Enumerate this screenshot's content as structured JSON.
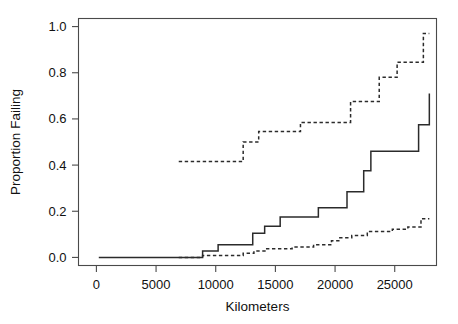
{
  "figure": {
    "background_color": "#ffffff",
    "ink_color": "#2b2b2b",
    "frame_color": "#4a4a4a"
  },
  "chart_data": {
    "type": "line",
    "title": "",
    "subtitle": "",
    "xlabel": "Kilometers",
    "ylabel": "Proportion Failing",
    "xlim": [
      -1500,
      28500
    ],
    "ylim": [
      -0.035,
      1.035
    ],
    "grid": false,
    "legend": "none",
    "annotations": [],
    "xticks": [
      0,
      5000,
      10000,
      15000,
      20000,
      25000
    ],
    "xticklabels": [
      "0",
      "5000",
      "10000",
      "15000",
      "20000",
      "25000"
    ],
    "yticks": [
      0.0,
      0.2,
      0.4,
      0.6,
      0.8,
      1.0
    ],
    "yticklabels": [
      "0.0",
      "0.2",
      "0.4",
      "0.6",
      "0.8",
      "1.0"
    ],
    "series": [
      {
        "name": "solid-step-curve",
        "style": "solid",
        "interpolation": "step-post",
        "x": [
          200,
          6800,
          8900,
          10200,
          12200,
          13100,
          14100,
          15400,
          17200,
          18600,
          20100,
          21000,
          22400,
          23000,
          24200,
          25500,
          27000,
          27900
        ],
        "y": [
          0.0,
          0.0,
          0.028,
          0.055,
          0.055,
          0.105,
          0.135,
          0.175,
          0.175,
          0.215,
          0.215,
          0.285,
          0.375,
          0.46,
          0.46,
          0.46,
          0.575,
          0.71
        ]
      },
      {
        "name": "dashed-upper-step-curve",
        "style": "dashed",
        "interpolation": "step-post",
        "x": [
          6900,
          11400,
          12300,
          13600,
          15600,
          17100,
          19400,
          21300,
          23700,
          25200,
          26500,
          27400,
          27900
        ],
        "y": [
          0.415,
          0.415,
          0.5,
          0.545,
          0.545,
          0.585,
          0.585,
          0.675,
          0.78,
          0.845,
          0.845,
          0.97,
          0.97
        ]
      },
      {
        "name": "dashed-lower-step-curve",
        "style": "dashed",
        "interpolation": "step-post",
        "x": [
          6900,
          8900,
          11400,
          12300,
          13200,
          14200,
          16400,
          18200,
          19700,
          20400,
          21400,
          22700,
          24800,
          26100,
          27200,
          27900
        ],
        "y": [
          0.0,
          0.008,
          0.008,
          0.018,
          0.028,
          0.038,
          0.045,
          0.055,
          0.072,
          0.085,
          0.095,
          0.112,
          0.122,
          0.132,
          0.168,
          0.168
        ]
      }
    ]
  }
}
